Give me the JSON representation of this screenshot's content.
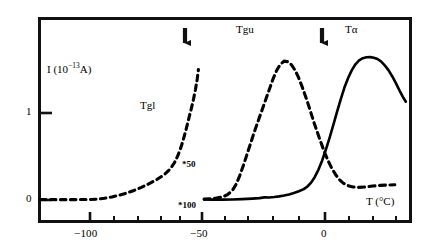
{
  "chart_data": {
    "type": "line",
    "title": "",
    "xlabel": "T (°C)",
    "ylabel": "I (10⁻¹³A)",
    "xlim": [
      -125,
      27
    ],
    "ylim": [
      -0.12,
      1.85
    ],
    "grid": false,
    "legend_position": "none",
    "x_major_ticks": [
      -100,
      -50,
      0
    ],
    "x_major_tick_labels": [
      "−100",
      "−50",
      "0"
    ],
    "x_minor_tick_step": 10,
    "y_ticks": [
      0,
      1
    ],
    "y_tick_labels": [
      "0",
      "1"
    ],
    "series": [
      {
        "name": "Tgl",
        "style": "dashed",
        "color": "#000000",
        "scale_annotation": "*100",
        "label": "Tgl",
        "points": [
          [
            -124.0,
            0.005
          ],
          [
            -120.0,
            0.005
          ],
          [
            -116.0,
            0.004
          ],
          [
            -112.0,
            0.004
          ],
          [
            -108.0,
            0.005
          ],
          [
            -104.0,
            0.006
          ],
          [
            -101.0,
            0.01
          ],
          [
            -98.0,
            0.02
          ],
          [
            -95.0,
            0.035
          ],
          [
            -92.0,
            0.055
          ],
          [
            -89.0,
            0.08
          ],
          [
            -86.0,
            0.11
          ],
          [
            -83.0,
            0.145
          ],
          [
            -80.0,
            0.185
          ],
          [
            -77.0,
            0.23
          ],
          [
            -74.0,
            0.285
          ],
          [
            -71.5,
            0.35
          ],
          [
            -69.5,
            0.43
          ],
          [
            -68.0,
            0.52
          ],
          [
            -66.5,
            0.64
          ],
          [
            -65.0,
            0.79
          ],
          [
            -63.5,
            0.96
          ],
          [
            -62.0,
            1.13
          ],
          [
            -61.0,
            1.27
          ],
          [
            -60.3,
            1.39
          ],
          [
            -59.8,
            1.5
          ]
        ]
      },
      {
        "name": "Tgu",
        "style": "dashed",
        "color": "#000000",
        "scale_annotation": "*50",
        "label": "Tgu",
        "points": [
          [
            -57.5,
            0.01
          ],
          [
            -55.0,
            0.015
          ],
          [
            -52.5,
            0.022
          ],
          [
            -50.0,
            0.035
          ],
          [
            -48.0,
            0.06
          ],
          [
            -46.0,
            0.11
          ],
          [
            -44.5,
            0.18
          ],
          [
            -43.0,
            0.28
          ],
          [
            -41.5,
            0.4
          ],
          [
            -40.0,
            0.53
          ],
          [
            -38.5,
            0.66
          ],
          [
            -37.0,
            0.79
          ],
          [
            -35.5,
            0.91
          ],
          [
            -34.0,
            1.03
          ],
          [
            -32.5,
            1.15
          ],
          [
            -31.0,
            1.27
          ],
          [
            -29.5,
            1.39
          ],
          [
            -28.0,
            1.49
          ],
          [
            -26.5,
            1.56
          ],
          [
            -25.0,
            1.595
          ],
          [
            -23.5,
            1.59
          ],
          [
            -22.0,
            1.555
          ],
          [
            -20.5,
            1.49
          ],
          [
            -19.0,
            1.4
          ],
          [
            -17.5,
            1.29
          ],
          [
            -16.0,
            1.17
          ],
          [
            -14.5,
            1.04
          ],
          [
            -13.0,
            0.905
          ],
          [
            -11.5,
            0.78
          ],
          [
            -10.0,
            0.66
          ],
          [
            -8.5,
            0.545
          ],
          [
            -7.0,
            0.445
          ],
          [
            -5.5,
            0.36
          ],
          [
            -4.0,
            0.29
          ],
          [
            -2.5,
            0.235
          ],
          [
            -1.0,
            0.195
          ],
          [
            1.0,
            0.165
          ],
          [
            3.0,
            0.15
          ],
          [
            5.0,
            0.145
          ],
          [
            8.0,
            0.15
          ],
          [
            11.0,
            0.16
          ],
          [
            14.0,
            0.168
          ],
          [
            17.0,
            0.172
          ],
          [
            20.0,
            0.175
          ]
        ]
      },
      {
        "name": "Talpha",
        "style": "solid",
        "color": "#000000",
        "label": "Tα",
        "points": [
          [
            -57.5,
            0.005
          ],
          [
            -54.0,
            0.004
          ],
          [
            -50.0,
            0.004
          ],
          [
            -46.0,
            0.006
          ],
          [
            -42.0,
            0.01
          ],
          [
            -38.0,
            0.016
          ],
          [
            -35.0,
            0.022
          ],
          [
            -33.0,
            0.03
          ],
          [
            -31.0,
            0.028
          ],
          [
            -29.0,
            0.034
          ],
          [
            -27.0,
            0.042
          ],
          [
            -25.0,
            0.052
          ],
          [
            -23.0,
            0.064
          ],
          [
            -21.0,
            0.08
          ],
          [
            -19.0,
            0.1
          ],
          [
            -17.0,
            0.125
          ],
          [
            -15.5,
            0.155
          ],
          [
            -14.0,
            0.2
          ],
          [
            -12.5,
            0.265
          ],
          [
            -11.0,
            0.35
          ],
          [
            -9.5,
            0.455
          ],
          [
            -8.0,
            0.58
          ],
          [
            -6.5,
            0.715
          ],
          [
            -5.0,
            0.86
          ],
          [
            -3.5,
            1.01
          ],
          [
            -2.0,
            1.155
          ],
          [
            -0.5,
            1.29
          ],
          [
            1.0,
            1.4
          ],
          [
            2.5,
            1.49
          ],
          [
            4.0,
            1.56
          ],
          [
            5.5,
            1.605
          ],
          [
            7.0,
            1.63
          ],
          [
            8.5,
            1.64
          ],
          [
            10.0,
            1.642
          ],
          [
            11.5,
            1.635
          ],
          [
            13.0,
            1.62
          ],
          [
            14.5,
            1.59
          ],
          [
            16.0,
            1.545
          ],
          [
            17.5,
            1.49
          ],
          [
            19.0,
            1.42
          ],
          [
            20.5,
            1.34
          ],
          [
            22.0,
            1.255
          ],
          [
            23.5,
            1.175
          ],
          [
            24.5,
            1.13
          ]
        ]
      }
    ],
    "annotations": [
      {
        "name": "arrow-tgu-onset",
        "type": "down-arrow",
        "x": -57,
        "label": ""
      },
      {
        "name": "arrow-talpha-onset",
        "type": "down-arrow",
        "x": -1,
        "label": ""
      },
      {
        "name": "scale-50",
        "type": "text",
        "text": "*50",
        "x": -48,
        "y": 0.49
      },
      {
        "name": "scale-100",
        "type": "text",
        "text": "*100",
        "x": -57,
        "y": -0.075
      },
      {
        "name": "curve-label-tgl",
        "type": "text",
        "text": "Tgl",
        "x": -79,
        "y": 1.07
      },
      {
        "name": "curve-label-tgu",
        "type": "text",
        "text": "Tgu",
        "x": -33,
        "y": 1.86
      },
      {
        "name": "curve-label-talpha",
        "type": "text",
        "text": "Tα",
        "x": 6,
        "y": 1.86
      }
    ]
  },
  "axis": {
    "y_label_prefix": "I (10",
    "y_label_exponent": "−13",
    "y_label_suffix": "A)",
    "x_label": "T (°C)",
    "y_tick_1": "1",
    "y_tick_0": "0",
    "x_tick_neg100": "−100",
    "x_tick_neg50": "−50",
    "x_tick_0": "0"
  },
  "labels": {
    "tgl": "Tgl",
    "tgu": "Tgu",
    "talpha": "Tα",
    "scale_50": "*50",
    "scale_100": "*100"
  }
}
